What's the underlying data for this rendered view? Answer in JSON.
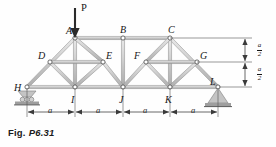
{
  "figure": {
    "caption_prefix": "Fig.",
    "caption_id": "P6.31",
    "load_label": "P",
    "type": "truss-free-body-diagram"
  },
  "nodes": [
    {
      "id": "A",
      "label": "A",
      "x": 75,
      "y": 38,
      "label_dx": -9,
      "label_dy": -12
    },
    {
      "id": "B",
      "label": "B",
      "x": 123,
      "y": 38,
      "label_dx": -3,
      "label_dy": -13
    },
    {
      "id": "C",
      "label": "C",
      "x": 170,
      "y": 38,
      "label_dx": -2,
      "label_dy": -13
    },
    {
      "id": "D",
      "label": "D",
      "x": 50,
      "y": 62,
      "label_dx": -12,
      "label_dy": -11
    },
    {
      "id": "E",
      "label": "E",
      "x": 103,
      "y": 62,
      "label_dx": 3,
      "label_dy": -11
    },
    {
      "id": "F",
      "label": "F",
      "x": 146,
      "y": 62,
      "label_dx": -12,
      "label_dy": -11
    },
    {
      "id": "G",
      "label": "G",
      "x": 197,
      "y": 62,
      "label_dx": 3,
      "label_dy": -11
    },
    {
      "id": "H",
      "label": "H",
      "x": 27,
      "y": 87,
      "label_dx": -13,
      "label_dy": -4
    },
    {
      "id": "I",
      "label": "I",
      "x": 75,
      "y": 87,
      "label_dx": -4,
      "label_dy": 8
    },
    {
      "id": "J",
      "label": "J",
      "x": 123,
      "y": 87,
      "label_dx": -4,
      "label_dy": 8
    },
    {
      "id": "K",
      "label": "K",
      "x": 170,
      "y": 87,
      "label_dx": -5,
      "label_dy": 8
    },
    {
      "id": "L",
      "label": "L",
      "x": 218,
      "y": 87,
      "label_dx": -8,
      "label_dy": -10
    }
  ],
  "members": [
    {
      "from": "H",
      "to": "A"
    },
    {
      "from": "A",
      "to": "B"
    },
    {
      "from": "B",
      "to": "C"
    },
    {
      "from": "C",
      "to": "L"
    },
    {
      "from": "H",
      "to": "I"
    },
    {
      "from": "I",
      "to": "J"
    },
    {
      "from": "J",
      "to": "K"
    },
    {
      "from": "K",
      "to": "L"
    },
    {
      "from": "A",
      "to": "I"
    },
    {
      "from": "B",
      "to": "J"
    },
    {
      "from": "C",
      "to": "K"
    },
    {
      "from": "D",
      "to": "I"
    },
    {
      "from": "A",
      "to": "E"
    },
    {
      "from": "E",
      "to": "J"
    },
    {
      "from": "J",
      "to": "F"
    },
    {
      "from": "F",
      "to": "C"
    },
    {
      "from": "K",
      "to": "G"
    },
    {
      "from": "E",
      "to": "I"
    },
    {
      "from": "F",
      "to": "K"
    },
    {
      "from": "D",
      "to": "E"
    },
    {
      "from": "F",
      "to": "G"
    }
  ],
  "load": {
    "label": "P",
    "at_node": "A",
    "arrow_x": 75,
    "arrow_top_y": 8,
    "arrow_tip_y": 37,
    "label_x": 81,
    "label_y": 6
  },
  "supports": {
    "left": {
      "node": "H",
      "kind": "roller",
      "x": 27,
      "y": 87
    },
    "right": {
      "node": "L",
      "kind": "pin",
      "x": 218,
      "y": 87
    }
  },
  "dimensions": {
    "horizontal": {
      "y": 112,
      "tick_x": [
        27,
        75,
        123,
        170,
        218
      ],
      "labels": [
        "a",
        "a",
        "a",
        "a"
      ]
    },
    "vertical": [
      {
        "numerator": "a",
        "denominator": "2",
        "from_y": 38,
        "to_y": 62,
        "x": 245
      },
      {
        "numerator": "a",
        "denominator": "2",
        "from_y": 62,
        "to_y": 87,
        "x": 245
      }
    ]
  },
  "colors": {
    "member_fill": "#c9c9c9",
    "member_edge": "#8f8f8f",
    "member_highlight": "#e8e8e8",
    "node_stroke": "#555555",
    "node_fill": "#ffffff",
    "ink": "#161616",
    "dim_line": "#3a3a3a",
    "support_fill": "#bdbdbd"
  }
}
